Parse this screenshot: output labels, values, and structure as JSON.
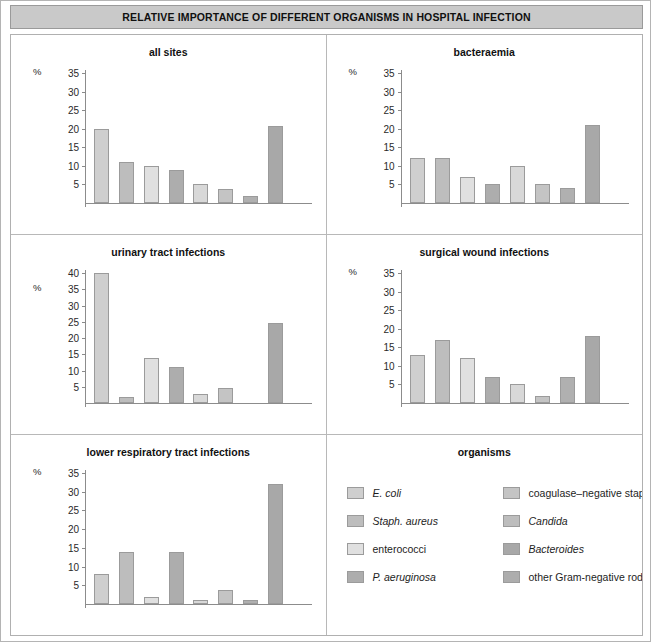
{
  "header": {
    "title": "RELATIVE IMPORTANCE OF DIFFERENT ORGANISMS IN HOSPITAL INFECTION"
  },
  "axis": {
    "unit_label": "%"
  },
  "legend": {
    "title": "organisms",
    "items": [
      {
        "label": "E. coli",
        "color": "#cfcfcf",
        "italic": true
      },
      {
        "label": "coagulase–negative staphs",
        "color": "#c4c4c4",
        "italic": false
      },
      {
        "label": "Staph. aureus",
        "color": "#bdbdbd",
        "italic": true
      },
      {
        "label": "Candida",
        "color": "#bdbdbd",
        "italic": true
      },
      {
        "label": "enterococci",
        "color": "#e0e0e0",
        "italic": false
      },
      {
        "label": "Bacteroides",
        "color": "#a8a8a8",
        "italic": true
      },
      {
        "label": "P. aeruginosa",
        "color": "#adadad",
        "italic": true
      },
      {
        "label": "other Gram-negative rods",
        "color": "#adadad",
        "italic": false
      }
    ]
  },
  "series_colors": [
    "#cfcfcf",
    "#bdbdbd",
    "#e0e0e0",
    "#adadad",
    "#d8d8d8",
    "#c4c4c4",
    "#b0b0b0",
    "#a8a8a8"
  ],
  "organisms_order": [
    "E. coli",
    "Staph. aureus",
    "enterococci",
    "P. aeruginosa",
    "coagulase–negative staphs",
    "Candida",
    "Bacteroides",
    "other Gram-negative rods"
  ],
  "chart_data": [
    {
      "type": "bar",
      "title": "all sites",
      "xlabel": "",
      "ylabel": "%",
      "ylim": [
        0,
        35
      ],
      "yticks": [
        5,
        10,
        15,
        20,
        25,
        30,
        35
      ],
      "grid": false,
      "categories": [
        "E. coli",
        "Staph. aureus",
        "enterococci",
        "P. aeruginosa",
        "coagulase–negative staphs",
        "Candida",
        "Bacteroides",
        "other Gram-negative rods"
      ],
      "values": [
        20,
        11,
        10,
        9,
        5,
        3.7,
        1.8,
        20.7
      ]
    },
    {
      "type": "bar",
      "title": "bacteraemia",
      "xlabel": "",
      "ylabel": "%",
      "ylim": [
        0,
        35
      ],
      "yticks": [
        5,
        10,
        15,
        20,
        25,
        30,
        35
      ],
      "grid": false,
      "categories": [
        "E. coli",
        "Staph. aureus",
        "enterococci",
        "P. aeruginosa",
        "coagulase–negative staphs",
        "Candida",
        "Bacteroides",
        "other Gram-negative rods"
      ],
      "values": [
        12,
        12,
        7,
        5,
        10,
        5,
        4,
        21
      ]
    },
    {
      "type": "bar",
      "title": "urinary tract infections",
      "xlabel": "",
      "ylabel": "%",
      "ylim": [
        0,
        40
      ],
      "yticks": [
        5,
        10,
        15,
        20,
        25,
        30,
        35,
        40
      ],
      "grid": false,
      "categories": [
        "E. coli",
        "Staph. aureus",
        "enterococci",
        "P. aeruginosa",
        "coagulase–negative staphs",
        "Candida",
        "Bacteroides",
        "other Gram-negative rods"
      ],
      "values": [
        40,
        2,
        14,
        11,
        2.7,
        4.7,
        0,
        24.7
      ]
    },
    {
      "type": "bar",
      "title": "surgical wound infections",
      "xlabel": "",
      "ylabel": "%",
      "ylim": [
        0,
        35
      ],
      "yticks": [
        5,
        10,
        15,
        20,
        25,
        30,
        35
      ],
      "grid": false,
      "categories": [
        "E. coli",
        "Staph. aureus",
        "enterococci",
        "P. aeruginosa",
        "coagulase–negative staphs",
        "Candida",
        "Bacteroides",
        "other Gram-negative rods"
      ],
      "values": [
        13,
        17,
        12,
        7,
        5,
        2,
        7,
        18
      ]
    },
    {
      "type": "bar",
      "title": "lower respiratory tract infections",
      "xlabel": "",
      "ylabel": "%",
      "ylim": [
        0,
        35
      ],
      "yticks": [
        5,
        10,
        15,
        20,
        25,
        30,
        35
      ],
      "grid": false,
      "categories": [
        "E. coli",
        "Staph. aureus",
        "enterococci",
        "P. aeruginosa",
        "coagulase–negative staphs",
        "Candida",
        "Bacteroides",
        "other Gram-negative rods"
      ],
      "values": [
        8,
        14,
        2,
        14,
        1,
        3.7,
        1,
        32
      ]
    }
  ]
}
